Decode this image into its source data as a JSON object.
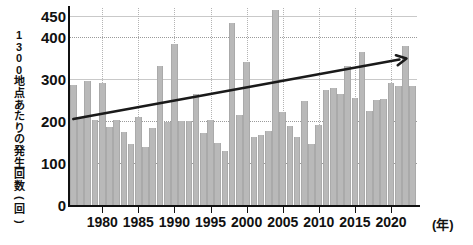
{
  "axis": {
    "y_label_text": "1300地点あたりの発生回数(回)",
    "y_label_chars": [
      "1",
      "3",
      "0",
      "0",
      "地",
      "点",
      "あ",
      "た",
      "り",
      "の",
      "発",
      "生",
      "回",
      "数",
      "(",
      "回",
      ")"
    ],
    "x_unit_label": "(年)",
    "y_ticks": [
      0,
      100,
      200,
      300,
      400,
      450
    ],
    "x_ticks": [
      1980,
      1985,
      1990,
      1995,
      2000,
      2005,
      2010,
      2015,
      2020
    ]
  },
  "colors": {
    "bar_fill": "#b9b9b9",
    "bar_edge": "#aaaaaa",
    "axis": "#111111",
    "grid_dotted": "#9a9a9a",
    "grid_solid": "#c9c9c9",
    "trend_line": "#1a1a1a",
    "background": "#ffffff"
  },
  "chart_data": {
    "type": "bar",
    "title": "",
    "subtitle": "",
    "xlabel": "(年)",
    "ylabel": "1300地点あたりの発生回数(回)",
    "xlim": [
      1975.4,
      2023.6
    ],
    "ylim": [
      0,
      470
    ],
    "grid": true,
    "legend": null,
    "y_gridlines": [
      100,
      200,
      300,
      400,
      450
    ],
    "x_gridlines": [
      1980,
      1985,
      1990,
      1995,
      2000,
      2005,
      2010,
      2015,
      2020
    ],
    "categories": [
      1976,
      1977,
      1978,
      1979,
      1980,
      1981,
      1982,
      1983,
      1984,
      1985,
      1986,
      1987,
      1988,
      1989,
      1990,
      1991,
      1992,
      1993,
      1994,
      1995,
      1996,
      1997,
      1998,
      1999,
      2000,
      2001,
      2002,
      2003,
      2004,
      2005,
      2006,
      2007,
      2008,
      2009,
      2010,
      2011,
      2012,
      2013,
      2014,
      2015,
      2016,
      2017,
      2018,
      2019,
      2020,
      2021,
      2022,
      2023
    ],
    "values": [
      287,
      208,
      296,
      202,
      292,
      186,
      203,
      175,
      145,
      211,
      139,
      183,
      331,
      197,
      385,
      200,
      201,
      265,
      171,
      203,
      148,
      130,
      435,
      215,
      342,
      163,
      166,
      176,
      465,
      221,
      188,
      163,
      247,
      145,
      190,
      274,
      280,
      264,
      332,
      256,
      364,
      225,
      251,
      253,
      292,
      284,
      380,
      283
    ],
    "series": [
      {
        "name": "1300地点あたりの発生回数",
        "values": [
          287,
          208,
          296,
          202,
          292,
          186,
          203,
          175,
          145,
          211,
          139,
          183,
          331,
          197,
          385,
          200,
          201,
          265,
          171,
          203,
          148,
          130,
          435,
          215,
          342,
          163,
          166,
          176,
          465,
          221,
          188,
          163,
          247,
          145,
          190,
          274,
          280,
          264,
          332,
          256,
          364,
          225,
          251,
          253,
          292,
          284,
          380,
          283
        ]
      }
    ],
    "annotations": [
      {
        "type": "trend-arrow",
        "label": "",
        "x_start": 1976,
        "y_start": 205,
        "x_end": 2022,
        "y_end": 352,
        "arrowhead": "end"
      }
    ]
  }
}
